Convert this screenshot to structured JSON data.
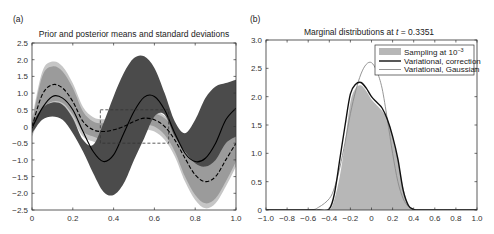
{
  "chart_data": [
    {
      "panel": "(a)",
      "type": "area",
      "title": "Prior and posterior means and standard deviations",
      "xlabel": "",
      "ylabel": "",
      "xlim": [
        0,
        1.0
      ],
      "ylim": [
        -2.5,
        2.5
      ],
      "xticks": [
        "0",
        "0.2",
        "0.4",
        "0.6",
        "0.8",
        "1.0"
      ],
      "yticks": [
        "2.5",
        "2.0",
        "1.5",
        "1.0",
        "0.5",
        "0",
        "−0.5",
        "−1.0",
        "−1.5",
        "−2.0",
        "−2.5"
      ],
      "grid": false,
      "x": [
        0,
        0.05,
        0.1,
        0.15,
        0.2,
        0.25,
        0.3,
        0.35,
        0.4,
        0.45,
        0.5,
        0.55,
        0.6,
        0.65,
        0.7,
        0.75,
        0.8,
        0.85,
        0.9,
        0.95,
        1.0
      ],
      "series": [
        {
          "name": "Prior mean (solid)",
          "style": "solid black",
          "values": [
            -0.05,
            0.55,
            0.9,
            0.85,
            0.5,
            -0.15,
            -0.75,
            -1.05,
            -0.85,
            -0.2,
            0.45,
            0.88,
            0.9,
            0.5,
            -0.2,
            -0.8,
            -1.05,
            -0.95,
            -0.5,
            0.2,
            0.55
          ]
        },
        {
          "name": "Prior std band (dark)",
          "style": "fill #4a4a4a",
          "upper": [
            0.1,
            0.55,
            0.72,
            0.65,
            0.25,
            -0.4,
            -0.55,
            0.1,
            0.9,
            1.6,
            2.05,
            2.1,
            1.75,
            1.0,
            0.15,
            -0.2,
            0.2,
            0.85,
            1.2,
            1.3,
            1.4
          ],
          "lower": [
            -0.2,
            0.2,
            0.3,
            0.2,
            -0.2,
            -0.75,
            -1.4,
            -1.95,
            -2.05,
            -1.7,
            -1.0,
            -0.35,
            0.3,
            0.35,
            -0.3,
            -0.75,
            -1.1,
            -1.2,
            -1.0,
            -0.5,
            -0.3
          ]
        },
        {
          "name": "Posterior mean (dashed)",
          "style": "dashed black",
          "values": [
            0.0,
            0.95,
            1.25,
            1.15,
            0.75,
            0.15,
            -0.1,
            -0.15,
            -0.1,
            0.0,
            0.15,
            0.25,
            0.2,
            0.0,
            -0.4,
            -0.95,
            -1.45,
            -1.65,
            -1.5,
            -1.0,
            -0.5
          ]
        },
        {
          "name": "Posterior std band (light)",
          "style": "fill #9a9a9a / #c4c4c4",
          "upper": [
            0.1,
            1.5,
            1.8,
            1.65,
            1.15,
            0.45,
            0.15,
            0.1,
            0.15,
            0.25,
            0.35,
            0.45,
            0.4,
            0.25,
            -0.05,
            -0.5,
            -0.85,
            -1.0,
            -0.85,
            -0.35,
            0.0
          ],
          "lower": [
            -0.15,
            0.5,
            0.75,
            0.7,
            0.35,
            -0.15,
            -0.3,
            -0.4,
            -0.35,
            -0.25,
            -0.05,
            0.05,
            0.0,
            -0.25,
            -0.75,
            -1.5,
            -2.05,
            -2.3,
            -2.15,
            -1.65,
            -1.05
          ]
        }
      ],
      "annotations": [
        {
          "type": "dashed rectangle",
          "x": [
            0.335,
            0.67
          ],
          "y": [
            -0.5,
            0.5
          ]
        }
      ]
    },
    {
      "panel": "(b)",
      "type": "area",
      "title": "Marginal distributions at t = 0.3351",
      "xlabel": "",
      "ylabel": "",
      "xlim": [
        -1.0,
        1.0
      ],
      "ylim": [
        0,
        3.0
      ],
      "xticks": [
        "−1.0",
        "−0.8",
        "−0.6",
        "−0.4",
        "−0.2",
        "0",
        "0.2",
        "0.4",
        "0.6",
        "0.8",
        "1.0"
      ],
      "yticks": [
        "3.0",
        "2.5",
        "2.0",
        "1.5",
        "1.0",
        "0.5",
        "0"
      ],
      "grid": false,
      "legend_position": "upper right",
      "x": [
        -1.0,
        -0.6,
        -0.5,
        -0.4,
        -0.35,
        -0.3,
        -0.25,
        -0.2,
        -0.15,
        -0.1,
        -0.05,
        0.0,
        0.05,
        0.1,
        0.15,
        0.2,
        0.25,
        0.3,
        0.35,
        0.4,
        0.5,
        1.0
      ],
      "series": [
        {
          "name": "Sampling at 10^-3",
          "style": "fill #b5b5b5",
          "values": [
            0,
            0,
            0,
            0.0,
            0.2,
            0.6,
            1.2,
            1.9,
            2.15,
            2.2,
            2.1,
            1.95,
            1.85,
            1.75,
            1.6,
            1.3,
            0.9,
            0.4,
            0.1,
            0.02,
            0,
            0
          ]
        },
        {
          "name": "Variational, correction",
          "style": "thick black",
          "values": [
            0,
            0,
            0,
            0.02,
            0.3,
            0.9,
            1.5,
            2.05,
            2.22,
            2.25,
            2.15,
            2.0,
            1.9,
            1.8,
            1.6,
            1.3,
            0.9,
            0.35,
            0.08,
            0.01,
            0,
            0
          ]
        },
        {
          "name": "Variational, Gaussian",
          "style": "thin gray",
          "values": [
            0,
            0.0,
            0.05,
            0.2,
            0.4,
            0.75,
            1.2,
            1.7,
            2.1,
            2.4,
            2.57,
            2.6,
            2.45,
            2.15,
            1.6,
            1.0,
            0.5,
            0.2,
            0.06,
            0.01,
            0,
            0
          ]
        }
      ],
      "legend": [
        "Sampling at 10⁻³",
        "Variational, correction",
        "Variational, Gaussian"
      ]
    }
  ],
  "panels": {
    "a": {
      "label": "(a)",
      "title": "Prior and posterior means and standard deviations",
      "yticks": [
        "2.5",
        "2.0",
        "1.5",
        "1.0",
        "0.5",
        "0",
        "−0.5",
        "−1.0",
        "−1.5",
        "−2.0",
        "−2.5"
      ],
      "xticks": [
        "0",
        "0.2",
        "0.4",
        "0.6",
        "0.8",
        "1.0"
      ]
    },
    "b": {
      "label": "(b)",
      "title_prefix": "Marginal distributions at ",
      "title_var": "t",
      "title_suffix": " = 0.3351",
      "yticks": [
        "3.0",
        "2.5",
        "2.0",
        "1.5",
        "1.0",
        "0.5",
        "0"
      ],
      "xticks": [
        "−1.0",
        "−0.8",
        "−0.6",
        "−0.4",
        "−0.2",
        "0",
        "0.2",
        "0.4",
        "0.6",
        "0.8",
        "1.0"
      ],
      "legend": {
        "sampling": "Sampling at 10",
        "sampling_exp": "−3",
        "correction": "Variational, correction",
        "gaussian": "Variational, Gaussian"
      }
    }
  },
  "colors": {
    "dark_band": "#4b4b4b",
    "mid_band": "#9b9b9b",
    "light_band": "#c6c6c6",
    "sampling_fill": "#b7b7b7",
    "gaussian_line": "#8a8a8a",
    "axis": "#333333"
  }
}
